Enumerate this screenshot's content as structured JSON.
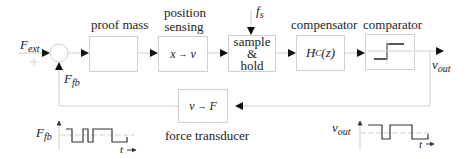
{
  "diagram": {
    "input": {
      "label": "F",
      "subscript": "ext"
    },
    "feedback_signal": {
      "label": "F",
      "subscript": "fb"
    },
    "sample_rate": {
      "label": "f",
      "subscript": "s"
    },
    "output": {
      "label": "v",
      "subscript": "out"
    },
    "blocks": [
      {
        "id": "proof-mass",
        "title": "proof mass",
        "content": ""
      },
      {
        "id": "position-sensing",
        "title_line1": "position",
        "title_line2": "sensing",
        "content_from": "x",
        "content_to": "v"
      },
      {
        "id": "sample-hold",
        "line1": "sample",
        "line2": "&",
        "line3": "hold"
      },
      {
        "id": "compensator",
        "title": "compensator",
        "content_main": "H",
        "content_sub": "C",
        "content_arg": "(z)"
      },
      {
        "id": "comparator",
        "title": "comparator"
      },
      {
        "id": "force-transducer",
        "title": "force transducer",
        "content_from": "v",
        "content_to": "F"
      }
    ],
    "waveforms": [
      {
        "id": "ffb-waveform",
        "ylabel": "F",
        "ylabel_sub": "fb",
        "xlabel": "t"
      },
      {
        "id": "vout-waveform",
        "ylabel": "v",
        "ylabel_sub": "out",
        "xlabel": "t"
      }
    ],
    "colors": {
      "line": "#cfcfcf",
      "arrow": "#111111",
      "signal": "#333333"
    }
  }
}
